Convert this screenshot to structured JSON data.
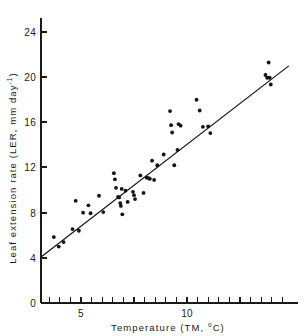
{
  "figure": {
    "background_color": "#ffffff",
    "ink_color": "#141414"
  },
  "axes": {
    "y": {
      "title_parts": {
        "main": "Leaf extension rate (LER, mm day",
        "exponent": "-1",
        "close": ")"
      },
      "title_plain": "Leaf extension rate (LER, mm day-1)",
      "tick_labels": [
        "0",
        "4",
        "8",
        "12",
        "16",
        "20",
        "24"
      ],
      "tick_values": [
        0,
        4,
        8,
        12,
        16,
        20,
        24
      ],
      "range": [
        0,
        25.8
      ]
    },
    "x": {
      "title_parts": {
        "main": "Temperature (TM, ",
        "degree": "o",
        "close": "C)"
      },
      "title_plain": "Temperature (TM, oC)",
      "tick_labels": [
        "5",
        "10"
      ],
      "labeled_tick_values": [
        5,
        10
      ],
      "minor_tick_values": [
        3.5,
        4,
        4.5,
        5,
        5.5,
        6,
        6.5,
        7,
        7.5,
        8,
        8.5,
        9,
        9.5,
        10,
        10.5,
        11,
        11.5,
        12,
        12.5,
        13,
        13.5,
        14,
        14.5
      ],
      "range": [
        3.1,
        14.9
      ]
    }
  },
  "chart_data": {
    "type": "scatter",
    "title": "",
    "xlabel": "Temperature (TM, oC)",
    "ylabel": "Leaf extension rate (LER, mm day-1)",
    "xlim": [
      3.1,
      14.9
    ],
    "ylim": [
      0,
      25.8
    ],
    "grid": false,
    "legend": "none",
    "marker": "filled-circle",
    "marker_color": "#121212",
    "points": [
      {
        "x": 3.72,
        "y": 5.84
      },
      {
        "x": 3.95,
        "y": 5.0
      },
      {
        "x": 4.18,
        "y": 5.4
      },
      {
        "x": 4.6,
        "y": 6.55
      },
      {
        "x": 4.75,
        "y": 9.05
      },
      {
        "x": 4.9,
        "y": 6.4
      },
      {
        "x": 5.1,
        "y": 8.0
      },
      {
        "x": 5.35,
        "y": 8.65
      },
      {
        "x": 5.45,
        "y": 7.95
      },
      {
        "x": 5.85,
        "y": 9.5
      },
      {
        "x": 6.05,
        "y": 8.05
      },
      {
        "x": 6.55,
        "y": 11.5
      },
      {
        "x": 6.6,
        "y": 10.95
      },
      {
        "x": 6.65,
        "y": 10.2
      },
      {
        "x": 6.75,
        "y": 9.4
      },
      {
        "x": 6.8,
        "y": 9.35
      },
      {
        "x": 6.85,
        "y": 8.85
      },
      {
        "x": 6.88,
        "y": 8.6
      },
      {
        "x": 6.92,
        "y": 10.1
      },
      {
        "x": 6.95,
        "y": 7.85
      },
      {
        "x": 7.1,
        "y": 9.95
      },
      {
        "x": 7.2,
        "y": 8.95
      },
      {
        "x": 7.45,
        "y": 9.85
      },
      {
        "x": 7.5,
        "y": 9.55
      },
      {
        "x": 7.55,
        "y": 9.2
      },
      {
        "x": 7.8,
        "y": 11.3
      },
      {
        "x": 7.95,
        "y": 9.75
      },
      {
        "x": 8.1,
        "y": 11.1
      },
      {
        "x": 8.2,
        "y": 11.05
      },
      {
        "x": 8.25,
        "y": 11.0
      },
      {
        "x": 8.35,
        "y": 12.6
      },
      {
        "x": 8.45,
        "y": 10.9
      },
      {
        "x": 8.6,
        "y": 12.2
      },
      {
        "x": 8.9,
        "y": 13.15
      },
      {
        "x": 9.2,
        "y": 17.0
      },
      {
        "x": 9.25,
        "y": 15.75
      },
      {
        "x": 9.3,
        "y": 15.1
      },
      {
        "x": 9.4,
        "y": 12.2
      },
      {
        "x": 9.55,
        "y": 13.55
      },
      {
        "x": 9.6,
        "y": 15.85
      },
      {
        "x": 9.7,
        "y": 15.7
      },
      {
        "x": 10.45,
        "y": 18.0
      },
      {
        "x": 10.6,
        "y": 17.05
      },
      {
        "x": 10.75,
        "y": 15.6
      },
      {
        "x": 11.0,
        "y": 15.65
      },
      {
        "x": 11.1,
        "y": 15.05
      },
      {
        "x": 13.85,
        "y": 21.3
      },
      {
        "x": 13.7,
        "y": 20.2
      },
      {
        "x": 13.78,
        "y": 19.95
      },
      {
        "x": 13.9,
        "y": 19.95
      },
      {
        "x": 13.95,
        "y": 19.35
      }
    ],
    "fit_line": {
      "label": "regression line",
      "x_start": 3.1,
      "y_start": 4.05,
      "x_end": 14.8,
      "y_end": 21.0
    }
  }
}
